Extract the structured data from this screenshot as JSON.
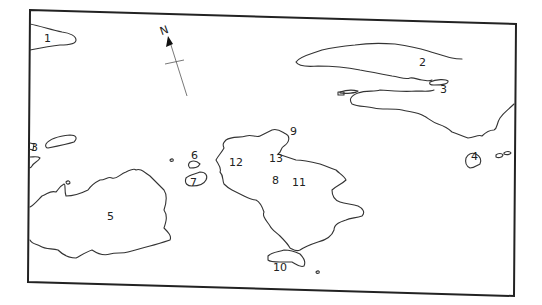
{
  "map": {
    "compass": {
      "label": "N"
    },
    "labels": [
      {
        "id": "1",
        "text": "1",
        "x": 44,
        "y": 42
      },
      {
        "id": "2",
        "text": "2",
        "x": 419,
        "y": 66
      },
      {
        "id": "3",
        "text": "3",
        "x": 440,
        "y": 93
      },
      {
        "id": "3b",
        "text": "3",
        "x": 31,
        "y": 151
      },
      {
        "id": "4",
        "text": "4",
        "x": 471,
        "y": 160
      },
      {
        "id": "5",
        "text": "5",
        "x": 107,
        "y": 220
      },
      {
        "id": "6",
        "text": "6",
        "x": 191,
        "y": 159
      },
      {
        "id": "7",
        "text": "7",
        "x": 190,
        "y": 186
      },
      {
        "id": "8",
        "text": "8",
        "x": 272,
        "y": 184
      },
      {
        "id": "9",
        "text": "9",
        "x": 290,
        "y": 135
      },
      {
        "id": "10",
        "text": "10",
        "x": 273,
        "y": 271
      },
      {
        "id": "11",
        "text": "11",
        "x": 292,
        "y": 186
      },
      {
        "id": "12",
        "text": "12",
        "x": 229,
        "y": 166
      },
      {
        "id": "13",
        "text": "13",
        "x": 269,
        "y": 162
      }
    ]
  }
}
